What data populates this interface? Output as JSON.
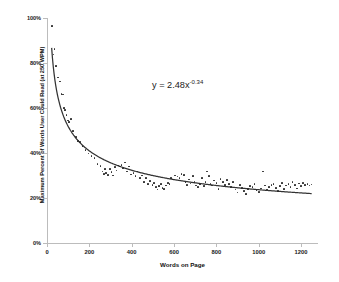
{
  "chart_data": {
    "type": "scatter",
    "title": "",
    "xlabel": "Words on Page",
    "ylabel": "Maximum Percent of Words User Could Read (at 250 WPM)",
    "xlim": [
      0,
      1280
    ],
    "ylim": [
      0,
      1.0
    ],
    "grid": false,
    "legend": null,
    "annotations": [
      {
        "text": "y = 2.48x",
        "exponent": "-0.34",
        "full_text": "y = 2.48x^-0.34",
        "x": 600,
        "y": 0.72
      }
    ],
    "xticks": [
      0,
      200,
      400,
      600,
      800,
      1000,
      1200
    ],
    "xtick_labels": [
      "0",
      "200",
      "400",
      "600",
      "800",
      "1000",
      "1200"
    ],
    "yticks": [
      0,
      0.2,
      0.4,
      0.6,
      0.8,
      1.0
    ],
    "ytick_labels": [
      "0%",
      "20%",
      "40%",
      "60%",
      "80%",
      "100%"
    ],
    "trendline": {
      "type": "power",
      "coefficient": 2.48,
      "exponent": -0.34,
      "equation": "y = 2.48x^-0.34",
      "color": "#333333"
    },
    "marker_color": "#2b2b2b",
    "axis_color": "#bcbcbc",
    "background_color": "#ffffff",
    "points": [
      [
        22,
        0.965
      ],
      [
        30,
        0.838
      ],
      [
        36,
        0.862
      ],
      [
        44,
        0.788
      ],
      [
        52,
        0.735
      ],
      [
        60,
        0.718
      ],
      [
        68,
        0.662
      ],
      [
        74,
        0.66
      ],
      [
        80,
        0.6
      ],
      [
        86,
        0.592
      ],
      [
        92,
        0.57
      ],
      [
        98,
        0.545
      ],
      [
        104,
        0.538
      ],
      [
        112,
        0.552
      ],
      [
        124,
        0.498
      ],
      [
        136,
        0.47
      ],
      [
        148,
        0.452
      ],
      [
        156,
        0.448
      ],
      [
        168,
        0.43
      ],
      [
        182,
        0.412
      ],
      [
        196,
        0.398
      ],
      [
        210,
        0.388
      ],
      [
        224,
        0.378
      ],
      [
        238,
        0.352
      ],
      [
        252,
        0.342
      ],
      [
        262,
        0.318
      ],
      [
        268,
        0.308
      ],
      [
        274,
        0.33
      ],
      [
        280,
        0.312
      ],
      [
        288,
        0.302
      ],
      [
        296,
        0.328
      ],
      [
        304,
        0.315
      ],
      [
        312,
        0.3
      ],
      [
        320,
        0.338
      ],
      [
        328,
        0.322
      ],
      [
        336,
        0.345
      ],
      [
        344,
        0.34
      ],
      [
        352,
        0.348
      ],
      [
        360,
        0.332
      ],
      [
        368,
        0.358
      ],
      [
        378,
        0.318
      ],
      [
        388,
        0.34
      ],
      [
        398,
        0.305
      ],
      [
        408,
        0.312
      ],
      [
        418,
        0.298
      ],
      [
        428,
        0.318
      ],
      [
        438,
        0.288
      ],
      [
        448,
        0.3
      ],
      [
        458,
        0.272
      ],
      [
        468,
        0.29
      ],
      [
        478,
        0.262
      ],
      [
        488,
        0.275
      ],
      [
        498,
        0.258
      ],
      [
        506,
        0.268
      ],
      [
        514,
        0.248
      ],
      [
        522,
        0.238
      ],
      [
        530,
        0.252
      ],
      [
        538,
        0.262
      ],
      [
        546,
        0.245
      ],
      [
        554,
        0.24
      ],
      [
        562,
        0.255
      ],
      [
        570,
        0.268
      ],
      [
        578,
        0.262
      ],
      [
        586,
        0.29
      ],
      [
        596,
        0.282
      ],
      [
        606,
        0.3
      ],
      [
        616,
        0.296
      ],
      [
        626,
        0.288
      ],
      [
        636,
        0.308
      ],
      [
        646,
        0.302
      ],
      [
        654,
        0.272
      ],
      [
        662,
        0.258
      ],
      [
        670,
        0.282
      ],
      [
        678,
        0.265
      ],
      [
        688,
        0.298
      ],
      [
        696,
        0.27
      ],
      [
        704,
        0.255
      ],
      [
        712,
        0.248
      ],
      [
        722,
        0.262
      ],
      [
        732,
        0.288
      ],
      [
        740,
        0.252
      ],
      [
        748,
        0.272
      ],
      [
        756,
        0.318
      ],
      [
        764,
        0.298
      ],
      [
        772,
        0.262
      ],
      [
        780,
        0.255
      ],
      [
        790,
        0.278
      ],
      [
        800,
        0.268
      ],
      [
        810,
        0.24
      ],
      [
        820,
        0.285
      ],
      [
        830,
        0.272
      ],
      [
        840,
        0.258
      ],
      [
        850,
        0.28
      ],
      [
        860,
        0.262
      ],
      [
        870,
        0.248
      ],
      [
        880,
        0.27
      ],
      [
        890,
        0.238
      ],
      [
        900,
        0.225
      ],
      [
        910,
        0.258
      ],
      [
        920,
        0.245
      ],
      [
        930,
        0.232
      ],
      [
        940,
        0.218
      ],
      [
        950,
        0.24
      ],
      [
        960,
        0.252
      ],
      [
        970,
        0.248
      ],
      [
        980,
        0.262
      ],
      [
        990,
        0.235
      ],
      [
        1000,
        0.228
      ],
      [
        1010,
        0.242
      ],
      [
        1020,
        0.318
      ],
      [
        1030,
        0.255
      ],
      [
        1040,
        0.238
      ],
      [
        1050,
        0.248
      ],
      [
        1060,
        0.258
      ],
      [
        1070,
        0.262
      ],
      [
        1080,
        0.245
      ],
      [
        1090,
        0.232
      ],
      [
        1100,
        0.252
      ],
      [
        1110,
        0.268
      ],
      [
        1120,
        0.24
      ],
      [
        1130,
        0.255
      ],
      [
        1140,
        0.262
      ],
      [
        1150,
        0.248
      ],
      [
        1160,
        0.272
      ],
      [
        1170,
        0.258
      ],
      [
        1180,
        0.242
      ],
      [
        1190,
        0.265
      ],
      [
        1200,
        0.252
      ],
      [
        1210,
        0.268
      ],
      [
        1220,
        0.258
      ],
      [
        1230,
        0.262
      ],
      [
        1240,
        0.255
      ],
      [
        1250,
        0.26
      ]
    ]
  }
}
